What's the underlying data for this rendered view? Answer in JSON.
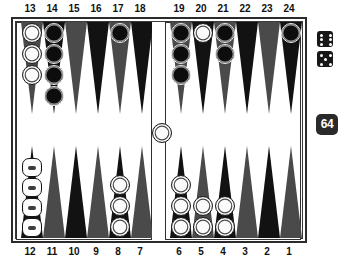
{
  "game": {
    "name": "backgammon-board",
    "colors": {
      "board_background": "#ffffff",
      "board_border": "#2b2b2b",
      "point_dark": "#121212",
      "point_light": "#4a4a4a",
      "white_checker": "#fbfbfb",
      "black_checker": "#0d0d0d",
      "dice_body": "#171717",
      "dice_pip": "#ffffff",
      "cube_body": "#2a2a2a",
      "cube_text": "#ffffff"
    }
  },
  "labels": {
    "top": [
      "13",
      "14",
      "15",
      "16",
      "17",
      "18",
      "19",
      "20",
      "21",
      "22",
      "23",
      "24"
    ],
    "bottom": [
      "12",
      "11",
      "10",
      "9",
      "8",
      "7",
      "6",
      "5",
      "4",
      "3",
      "2",
      "1"
    ]
  },
  "points": [
    {
      "number": "13",
      "row": "top",
      "quadrant": "left",
      "shade": "light",
      "checkers": 3,
      "color": "white",
      "style": "round"
    },
    {
      "number": "14",
      "row": "top",
      "quadrant": "left",
      "shade": "dark",
      "checkers": 4,
      "color": "black",
      "style": "round"
    },
    {
      "number": "15",
      "row": "top",
      "quadrant": "left",
      "shade": "light",
      "checkers": 0,
      "color": "none",
      "style": "round"
    },
    {
      "number": "16",
      "row": "top",
      "quadrant": "left",
      "shade": "dark",
      "checkers": 0,
      "color": "none",
      "style": "round"
    },
    {
      "number": "17",
      "row": "top",
      "quadrant": "left",
      "shade": "light",
      "checkers": 1,
      "color": "black",
      "style": "round"
    },
    {
      "number": "18",
      "row": "top",
      "quadrant": "left",
      "shade": "dark",
      "checkers": 0,
      "color": "none",
      "style": "round"
    },
    {
      "number": "19",
      "row": "top",
      "quadrant": "right",
      "shade": "light",
      "checkers": 3,
      "color": "black",
      "style": "round"
    },
    {
      "number": "20",
      "row": "top",
      "quadrant": "right",
      "shade": "dark",
      "checkers": 1,
      "color": "white",
      "style": "round"
    },
    {
      "number": "21",
      "row": "top",
      "quadrant": "right",
      "shade": "light",
      "checkers": 2,
      "color": "black",
      "style": "round"
    },
    {
      "number": "22",
      "row": "top",
      "quadrant": "right",
      "shade": "dark",
      "checkers": 0,
      "color": "none",
      "style": "round"
    },
    {
      "number": "23",
      "row": "top",
      "quadrant": "right",
      "shade": "light",
      "checkers": 0,
      "color": "none",
      "style": "round"
    },
    {
      "number": "24",
      "row": "top",
      "quadrant": "right",
      "shade": "dark",
      "checkers": 1,
      "color": "black",
      "style": "round"
    },
    {
      "number": "12",
      "row": "bottom",
      "quadrant": "left",
      "shade": "dark",
      "checkers": 4,
      "color": "white",
      "style": "stack"
    },
    {
      "number": "11",
      "row": "bottom",
      "quadrant": "left",
      "shade": "light",
      "checkers": 0,
      "color": "none",
      "style": "round"
    },
    {
      "number": "10",
      "row": "bottom",
      "quadrant": "left",
      "shade": "dark",
      "checkers": 0,
      "color": "none",
      "style": "round"
    },
    {
      "number": "9",
      "row": "bottom",
      "quadrant": "left",
      "shade": "light",
      "checkers": 0,
      "color": "none",
      "style": "round"
    },
    {
      "number": "8",
      "row": "bottom",
      "quadrant": "left",
      "shade": "dark",
      "checkers": 3,
      "color": "white",
      "style": "round"
    },
    {
      "number": "7",
      "row": "bottom",
      "quadrant": "left",
      "shade": "light",
      "checkers": 0,
      "color": "none",
      "style": "round"
    },
    {
      "number": "6",
      "row": "bottom",
      "quadrant": "right",
      "shade": "dark",
      "checkers": 3,
      "color": "white",
      "style": "round"
    },
    {
      "number": "5",
      "row": "bottom",
      "quadrant": "right",
      "shade": "light",
      "checkers": 2,
      "color": "white",
      "style": "round"
    },
    {
      "number": "4",
      "row": "bottom",
      "quadrant": "right",
      "shade": "dark",
      "checkers": 2,
      "color": "white",
      "style": "round"
    },
    {
      "number": "3",
      "row": "bottom",
      "quadrant": "right",
      "shade": "light",
      "checkers": 0,
      "color": "none",
      "style": "round"
    },
    {
      "number": "2",
      "row": "bottom",
      "quadrant": "right",
      "shade": "dark",
      "checkers": 0,
      "color": "none",
      "style": "round"
    },
    {
      "number": "1",
      "row": "bottom",
      "quadrant": "right",
      "shade": "light",
      "checkers": 0,
      "color": "none",
      "style": "round"
    }
  ],
  "bar": {
    "white_checkers": 1,
    "black_checkers": 0
  },
  "dice": [
    {
      "name": "die-one",
      "value": 6
    },
    {
      "name": "die-two",
      "value": 5
    }
  ],
  "doubling_cube": {
    "value": "64"
  }
}
